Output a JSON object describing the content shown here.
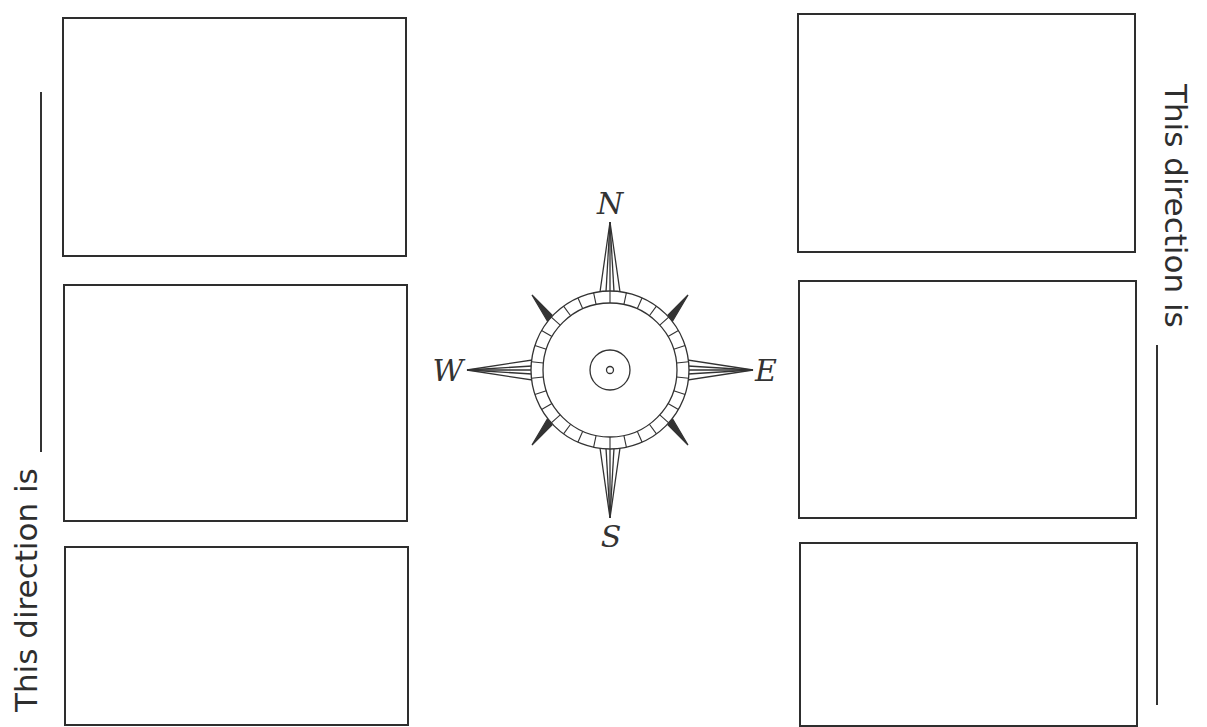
{
  "worksheet": {
    "left_prompt": "This direction is",
    "right_prompt": "This direction is",
    "left_boxes": [
      {
        "label": ""
      },
      {
        "label": ""
      },
      {
        "label": ""
      }
    ],
    "right_boxes": [
      {
        "label": ""
      },
      {
        "label": ""
      },
      {
        "label": ""
      }
    ]
  },
  "compass": {
    "north": "N",
    "south": "S",
    "east": "E",
    "west": "W",
    "icon": "compass-rose-icon"
  },
  "colors": {
    "ink": "#2e2e2e",
    "background": "#ffffff"
  }
}
